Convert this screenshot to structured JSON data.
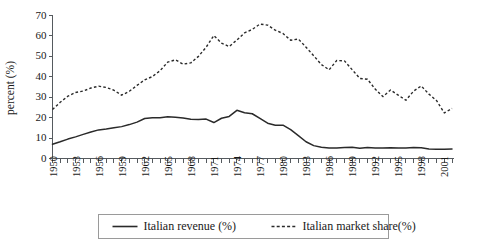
{
  "chart_data": {
    "type": "line",
    "title": "",
    "xlabel": "",
    "ylabel": "percent (%)",
    "ylim": [
      0,
      70
    ],
    "xlim": [
      1950,
      2002
    ],
    "ytick_step": 10,
    "xtick_label_step": 3,
    "grid": false,
    "legend_position": "bottom",
    "yticks": [
      0,
      10,
      20,
      30,
      40,
      50,
      60,
      70
    ],
    "xticks_labeled": [
      1950,
      1953,
      1956,
      1959,
      1962,
      1965,
      1968,
      1971,
      1974,
      1977,
      1980,
      1983,
      1986,
      1989,
      1992,
      1995,
      1998,
      2001
    ],
    "x": [
      1950,
      1951,
      1952,
      1953,
      1954,
      1955,
      1956,
      1957,
      1958,
      1959,
      1960,
      1961,
      1962,
      1963,
      1964,
      1965,
      1966,
      1967,
      1968,
      1969,
      1970,
      1971,
      1972,
      1973,
      1974,
      1975,
      1976,
      1977,
      1978,
      1979,
      1980,
      1981,
      1982,
      1983,
      1984,
      1985,
      1986,
      1987,
      1988,
      1989,
      1990,
      1991,
      1992,
      1993,
      1994,
      1995,
      1996,
      1997,
      1998,
      1999,
      2000,
      2001,
      2002
    ],
    "series": [
      {
        "name": "Italian revenue (%)",
        "style": "solid",
        "color": "#2a2a2a",
        "values": [
          7.0,
          8.2,
          9.5,
          10.6,
          11.8,
          13.0,
          14.0,
          14.4,
          15.0,
          15.6,
          16.6,
          17.8,
          19.6,
          19.9,
          19.9,
          20.4,
          20.2,
          19.8,
          19.2,
          19.1,
          19.3,
          17.6,
          19.7,
          20.6,
          23.6,
          22.4,
          21.9,
          19.6,
          17.3,
          16.3,
          16.3,
          14.1,
          11.2,
          8.2,
          6.3,
          5.5,
          5.2,
          5.2,
          5.4,
          5.5,
          5.0,
          5.4,
          5.1,
          5.2,
          5.3,
          5.2,
          5.2,
          5.4,
          5.3,
          4.7,
          4.5,
          4.5,
          4.6
        ]
      },
      {
        "name": "Italian market share(%)",
        "style": "dashed",
        "color": "#2a2a2a",
        "values": [
          24.0,
          27.5,
          30.5,
          32.3,
          33.0,
          34.5,
          35.4,
          34.8,
          33.4,
          31.0,
          32.9,
          35.8,
          38.5,
          40.1,
          43.0,
          47.2,
          48.3,
          46.2,
          46.8,
          50.0,
          54.5,
          60.2,
          56.5,
          54.8,
          58.0,
          61.5,
          63.2,
          65.8,
          65.3,
          62.8,
          61.2,
          57.9,
          58.5,
          54.5,
          50.3,
          46.0,
          43.4,
          48.0,
          47.8,
          43.5,
          39.2,
          38.8,
          34.0,
          30.3,
          33.5,
          31.0,
          28.5,
          33.0,
          35.5,
          31.5,
          28.3,
          22.3,
          24.5
        ]
      }
    ]
  },
  "legend": {
    "items": [
      {
        "label": "Italian revenue (%)",
        "style": "solid"
      },
      {
        "label": "Italian market share(%)",
        "style": "dashed"
      }
    ]
  }
}
